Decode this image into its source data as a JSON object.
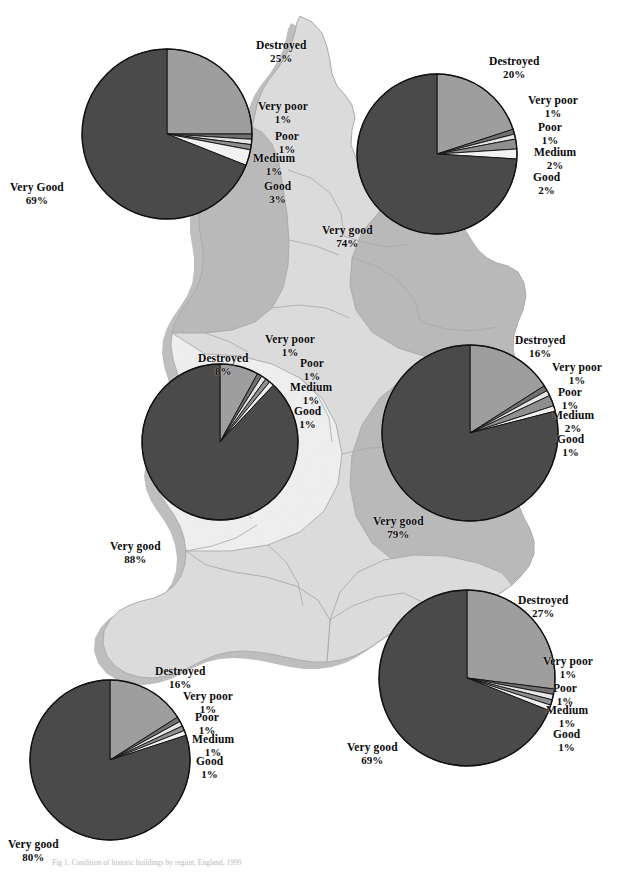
{
  "figure": {
    "title": "Condition of historic buildings by region",
    "caption": "Fig 1. Condition of historic buildings by region, England, 1999",
    "colors": {
      "very_good": "#4a4a4a",
      "good": "#f2f2f2",
      "medium": "#8f8f8f",
      "poor": "#e6e6e6",
      "very_poor": "#707070",
      "destroyed": "#9e9e9e",
      "outline": "#111111",
      "map_light": "#dcdcdc",
      "map_pale": "#efefef",
      "map_mid": "#b9b9b9",
      "map_dark": "#8c8c8c",
      "map_border": "#a8a8a8",
      "map_shadow": "#8a8a8a",
      "label_text": "#0b0b0b",
      "background": "#ffffff"
    },
    "slice_order": [
      "Destroyed",
      "Very poor",
      "Poor",
      "Medium",
      "Good",
      "Very good"
    ]
  },
  "chart_data": {
    "type": "pie",
    "title": "Condition of historic buildings by region",
    "categories": [
      "Destroyed",
      "Very poor",
      "Poor",
      "Medium",
      "Good",
      "Very good"
    ],
    "units": "percent",
    "legend": "none",
    "charts": [
      {
        "id": "north-west",
        "position": "top-left",
        "center_x": 167,
        "center_y": 134,
        "radius": 85,
        "slices": [
          {
            "label": "Destroyed",
            "value": 25,
            "text": "Destroyed",
            "pct": "25%",
            "color": "#9e9e9e"
          },
          {
            "label": "Very poor",
            "value": 1,
            "text": "Very poor",
            "pct": "1%",
            "color": "#707070"
          },
          {
            "label": "Poor",
            "value": 1,
            "text": "Poor",
            "pct": "1%",
            "color": "#e6e6e6"
          },
          {
            "label": "Medium",
            "value": 1,
            "text": "Medium",
            "pct": "1%",
            "color": "#8f8f8f"
          },
          {
            "label": "Good",
            "value": 3,
            "text": "Good",
            "pct": "3%",
            "color": "#f2f2f2"
          },
          {
            "label": "Very Good",
            "value": 69,
            "text": "Very Good",
            "pct": "69%",
            "color": "#4a4a4a"
          }
        ],
        "labels": [
          {
            "text": "Destroyed",
            "pct": "25%",
            "x": 256,
            "y": 39,
            "anchor": "start"
          },
          {
            "text": "Very poor",
            "pct": "1%",
            "x": 258,
            "y": 100,
            "anchor": "start"
          },
          {
            "text": "Poor",
            "pct": "1%",
            "x": 275,
            "y": 130,
            "anchor": "start"
          },
          {
            "text": "Medium",
            "pct": "1%",
            "x": 253,
            "y": 152,
            "anchor": "start"
          },
          {
            "text": "Good",
            "pct": "3%",
            "x": 264,
            "y": 180,
            "anchor": "start"
          },
          {
            "text": "Very Good",
            "pct": "69%",
            "x": 10,
            "y": 181,
            "anchor": "start"
          }
        ]
      },
      {
        "id": "north-east",
        "position": "top-right",
        "center_x": 437,
        "center_y": 154,
        "radius": 80,
        "slices": [
          {
            "label": "Destroyed",
            "value": 20,
            "text": "Destroyed",
            "pct": "20%",
            "color": "#9e9e9e"
          },
          {
            "label": "Very poor",
            "value": 1,
            "text": "Very poor",
            "pct": "1%",
            "color": "#707070"
          },
          {
            "label": "Poor",
            "value": 1,
            "text": "Poor",
            "pct": "1%",
            "color": "#e6e6e6"
          },
          {
            "label": "Medium",
            "value": 2,
            "text": "Medium",
            "pct": "2%",
            "color": "#8f8f8f"
          },
          {
            "label": "Good",
            "value": 2,
            "text": "Good",
            "pct": "2%",
            "color": "#f2f2f2"
          },
          {
            "label": "Very good",
            "value": 74,
            "text": "Very good",
            "pct": "74%",
            "color": "#4a4a4a"
          }
        ],
        "labels": [
          {
            "text": "Destroyed",
            "pct": "20%",
            "x": 489,
            "y": 55,
            "anchor": "start"
          },
          {
            "text": "Very poor",
            "pct": "1%",
            "x": 528,
            "y": 94,
            "anchor": "start"
          },
          {
            "text": "Poor",
            "pct": "1%",
            "x": 538,
            "y": 121,
            "anchor": "start"
          },
          {
            "text": "Medium",
            "pct": "2%",
            "x": 534,
            "y": 146,
            "anchor": "start"
          },
          {
            "text": "Good",
            "pct": "2%",
            "x": 533,
            "y": 171,
            "anchor": "start"
          },
          {
            "text": "Very good",
            "pct": "74%",
            "x": 322,
            "y": 224,
            "anchor": "start"
          }
        ]
      },
      {
        "id": "west-midlands",
        "position": "middle-left",
        "center_x": 220,
        "center_y": 442,
        "radius": 78,
        "slices": [
          {
            "label": "Destroyed",
            "value": 8,
            "text": "Destroyed",
            "pct": "8%",
            "color": "#9e9e9e"
          },
          {
            "label": "Very poor",
            "value": 1,
            "text": "Very poor",
            "pct": "1%",
            "color": "#707070"
          },
          {
            "label": "Poor",
            "value": 1,
            "text": "Poor",
            "pct": "1%",
            "color": "#e6e6e6"
          },
          {
            "label": "Medium",
            "value": 1,
            "text": "Medium",
            "pct": "1%",
            "color": "#8f8f8f"
          },
          {
            "label": "Good",
            "value": 1,
            "text": "Good",
            "pct": "1%",
            "color": "#f2f2f2"
          },
          {
            "label": "Very good",
            "value": 88,
            "text": "Very good",
            "pct": "88%",
            "color": "#4a4a4a"
          }
        ],
        "labels": [
          {
            "text": "Very poor",
            "pct": "1%",
            "x": 265,
            "y": 333,
            "anchor": "start"
          },
          {
            "text": "Destroyed",
            "pct": "8%",
            "x": 198,
            "y": 352,
            "anchor": "start"
          },
          {
            "text": "Poor",
            "pct": "1%",
            "x": 300,
            "y": 357,
            "anchor": "start"
          },
          {
            "text": "Medium",
            "pct": "1%",
            "x": 290,
            "y": 381,
            "anchor": "start"
          },
          {
            "text": "Good",
            "pct": "1%",
            "x": 294,
            "y": 405,
            "anchor": "start"
          },
          {
            "text": "Very good",
            "pct": "88%",
            "x": 110,
            "y": 540,
            "anchor": "start"
          }
        ]
      },
      {
        "id": "east-midlands",
        "position": "middle-right",
        "center_x": 470,
        "center_y": 433,
        "radius": 88,
        "slices": [
          {
            "label": "Destroyed",
            "value": 16,
            "text": "Destroyed",
            "pct": "16%",
            "color": "#9e9e9e"
          },
          {
            "label": "Very poor",
            "value": 1,
            "text": "Very poor",
            "pct": "1%",
            "color": "#707070"
          },
          {
            "label": "Poor",
            "value": 1,
            "text": "Poor",
            "pct": "1%",
            "color": "#e6e6e6"
          },
          {
            "label": "Medium",
            "value": 2,
            "text": "Medium",
            "pct": "2%",
            "color": "#8f8f8f"
          },
          {
            "label": "Good",
            "value": 1,
            "text": "Good",
            "pct": "1%",
            "color": "#f2f2f2"
          },
          {
            "label": "Very good",
            "value": 79,
            "text": "Very good",
            "pct": "79%",
            "color": "#4a4a4a"
          }
        ],
        "labels": [
          {
            "text": "Destroyed",
            "pct": "16%",
            "x": 515,
            "y": 334,
            "anchor": "start"
          },
          {
            "text": "Very poor",
            "pct": "1%",
            "x": 552,
            "y": 361,
            "anchor": "start"
          },
          {
            "text": "Poor",
            "pct": "1%",
            "x": 558,
            "y": 386,
            "anchor": "start"
          },
          {
            "text": "Medium",
            "pct": "2%",
            "x": 552,
            "y": 409,
            "anchor": "start"
          },
          {
            "text": "Good",
            "pct": "1%",
            "x": 557,
            "y": 433,
            "anchor": "start"
          },
          {
            "text": "Very good",
            "pct": "79%",
            "x": 373,
            "y": 515,
            "anchor": "start"
          }
        ]
      },
      {
        "id": "south-west",
        "position": "bottom-left",
        "center_x": 110,
        "center_y": 760,
        "radius": 80,
        "slices": [
          {
            "label": "Destroyed",
            "value": 16,
            "text": "Destroyed",
            "pct": "16%",
            "color": "#9e9e9e"
          },
          {
            "label": "Very poor",
            "value": 1,
            "text": "Very poor",
            "pct": "1%",
            "color": "#707070"
          },
          {
            "label": "Poor",
            "value": 1,
            "text": "Poor",
            "pct": "1%",
            "color": "#e6e6e6"
          },
          {
            "label": "Medium",
            "value": 1,
            "text": "Medium",
            "pct": "1%",
            "color": "#8f8f8f"
          },
          {
            "label": "Good",
            "value": 1,
            "text": "Good",
            "pct": "1%",
            "color": "#f2f2f2"
          },
          {
            "label": "Very good",
            "value": 80,
            "text": "Very good",
            "pct": "80%",
            "color": "#4a4a4a"
          }
        ],
        "labels": [
          {
            "text": "Destroyed",
            "pct": "16%",
            "x": 155,
            "y": 665,
            "anchor": "start"
          },
          {
            "text": "Very poor",
            "pct": "1%",
            "x": 183,
            "y": 690,
            "anchor": "start"
          },
          {
            "text": "Poor",
            "pct": "1%",
            "x": 195,
            "y": 711,
            "anchor": "start"
          },
          {
            "text": "Medium",
            "pct": "1%",
            "x": 192,
            "y": 733,
            "anchor": "start"
          },
          {
            "text": "Good",
            "pct": "1%",
            "x": 196,
            "y": 755,
            "anchor": "start"
          },
          {
            "text": "Very good",
            "pct": "80%",
            "x": 8,
            "y": 838,
            "anchor": "start"
          }
        ]
      },
      {
        "id": "south-east",
        "position": "bottom-right",
        "center_x": 467,
        "center_y": 678,
        "radius": 88,
        "slices": [
          {
            "label": "Destroyed",
            "value": 27,
            "text": "Destroyed",
            "pct": "27%",
            "color": "#9e9e9e"
          },
          {
            "label": "Very poor",
            "value": 1,
            "text": "Very poor",
            "pct": "1%",
            "color": "#707070"
          },
          {
            "label": "Poor",
            "value": 1,
            "text": "Poor",
            "pct": "1%",
            "color": "#e6e6e6"
          },
          {
            "label": "Medium",
            "value": 1,
            "text": "Medium",
            "pct": "1%",
            "color": "#8f8f8f"
          },
          {
            "label": "Good",
            "value": 1,
            "text": "Good",
            "pct": "1%",
            "color": "#f2f2f2"
          },
          {
            "label": "Very good",
            "value": 69,
            "text": "Very good",
            "pct": "69%",
            "color": "#4a4a4a"
          }
        ],
        "labels": [
          {
            "text": "Destroyed",
            "pct": "27%",
            "x": 518,
            "y": 594,
            "anchor": "start"
          },
          {
            "text": "Very poor",
            "pct": "1%",
            "x": 543,
            "y": 655,
            "anchor": "start"
          },
          {
            "text": "Poor",
            "pct": "1%",
            "x": 553,
            "y": 682,
            "anchor": "start"
          },
          {
            "text": "Medium",
            "pct": "1%",
            "x": 546,
            "y": 704,
            "anchor": "start"
          },
          {
            "text": "Good",
            "pct": "1%",
            "x": 553,
            "y": 728,
            "anchor": "start"
          },
          {
            "text": "Very good",
            "pct": "69%",
            "x": 347,
            "y": 741,
            "anchor": "start"
          }
        ]
      }
    ]
  }
}
